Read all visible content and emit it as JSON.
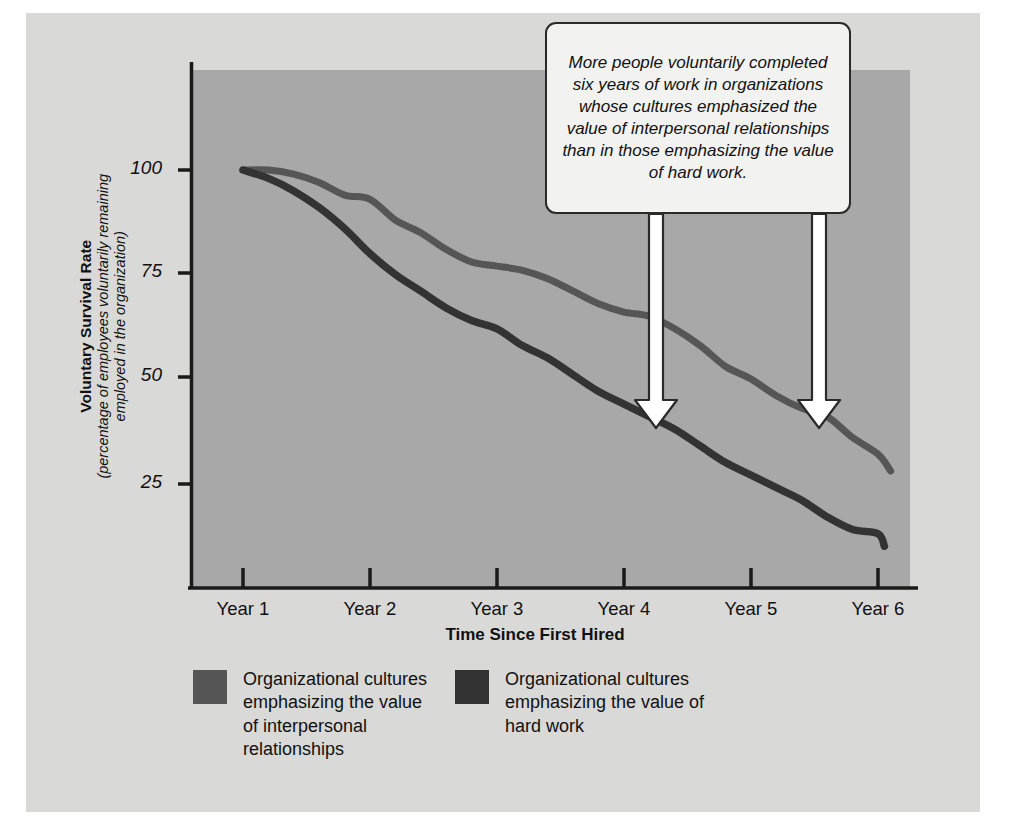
{
  "figure": {
    "panel_bg": "#d9d9d7",
    "plot_bg": "#a8a8a8",
    "axis_color": "#1a1a1a"
  },
  "y_axis": {
    "title_main": "Voluntary Survival Rate",
    "title_sub": "(percentage of employees voluntarily remaining employed in the organization)",
    "ticks": [
      "100",
      "75",
      "50",
      "25"
    ]
  },
  "x_axis": {
    "title": "Time Since First Hired",
    "ticks": [
      "Year 1",
      "Year 2",
      "Year 3",
      "Year 4",
      "Year 5",
      "Year 6"
    ]
  },
  "callout": {
    "text": "More people voluntarily completed six years of work in organizations whose cultures emphasized the value of interpersonal relationships than in those emphasizing the value of hard work."
  },
  "legend": {
    "items": [
      {
        "label": "Organizational cultures emphasizing the value of interpersonal relationships",
        "color": "#565656"
      },
      {
        "label": "Organizational cultures emphasizing the value of hard work",
        "color": "#333333"
      }
    ]
  },
  "chart_data": {
    "type": "line",
    "title": "Voluntary Survival Rate",
    "xlabel": "Time Since First Hired",
    "ylabel": "Voluntary Survival Rate (percentage of employees voluntarily remaining employed in the organization)",
    "x": [
      "Year 1",
      "Year 2",
      "Year 3",
      "Year 4",
      "Year 5",
      "Year 6"
    ],
    "xlim": [
      1,
      6
    ],
    "ylim": [
      0,
      112
    ],
    "yticks": [
      25,
      50,
      75,
      100
    ],
    "grid": false,
    "legend_position": "below-axes",
    "series": [
      {
        "name": "Organizational cultures emphasizing the value of interpersonal relationships",
        "color": "#565656",
        "values": [
          100,
          93,
          77,
          66,
          50,
          28
        ],
        "points": [
          [
            1.0,
            100
          ],
          [
            1.2,
            100
          ],
          [
            1.4,
            99
          ],
          [
            1.6,
            97
          ],
          [
            1.8,
            94
          ],
          [
            2.0,
            93
          ],
          [
            2.2,
            88
          ],
          [
            2.4,
            85
          ],
          [
            2.6,
            81
          ],
          [
            2.8,
            78
          ],
          [
            3.0,
            77
          ],
          [
            3.2,
            76
          ],
          [
            3.4,
            74
          ],
          [
            3.6,
            71
          ],
          [
            3.8,
            68
          ],
          [
            4.0,
            66
          ],
          [
            4.2,
            65
          ],
          [
            4.4,
            62
          ],
          [
            4.6,
            58
          ],
          [
            4.8,
            53
          ],
          [
            5.0,
            50
          ],
          [
            5.2,
            46
          ],
          [
            5.4,
            43
          ],
          [
            5.6,
            41
          ],
          [
            5.8,
            36
          ],
          [
            6.0,
            32
          ],
          [
            6.1,
            28
          ]
        ]
      },
      {
        "name": "Organizational cultures emphasizing the value of hard work",
        "color": "#333333",
        "values": [
          100,
          80,
          62,
          44,
          27,
          10
        ],
        "points": [
          [
            1.0,
            100
          ],
          [
            1.2,
            98
          ],
          [
            1.4,
            95
          ],
          [
            1.6,
            91
          ],
          [
            1.8,
            86
          ],
          [
            2.0,
            80
          ],
          [
            2.2,
            75
          ],
          [
            2.4,
            71
          ],
          [
            2.6,
            67
          ],
          [
            2.8,
            64
          ],
          [
            3.0,
            62
          ],
          [
            3.2,
            58
          ],
          [
            3.4,
            55
          ],
          [
            3.6,
            51
          ],
          [
            3.8,
            47
          ],
          [
            4.0,
            44
          ],
          [
            4.2,
            41
          ],
          [
            4.4,
            38
          ],
          [
            4.6,
            34
          ],
          [
            4.8,
            30
          ],
          [
            5.0,
            27
          ],
          [
            5.2,
            24
          ],
          [
            5.4,
            21
          ],
          [
            5.6,
            17
          ],
          [
            5.8,
            14
          ],
          [
            6.0,
            13
          ],
          [
            6.05,
            10
          ]
        ]
      }
    ],
    "annotations": [
      {
        "name": "arrow-left",
        "x": 4.24,
        "points_to_series": 0
      },
      {
        "name": "arrow-right",
        "x": 5.53,
        "points_to_series": 0
      }
    ]
  }
}
